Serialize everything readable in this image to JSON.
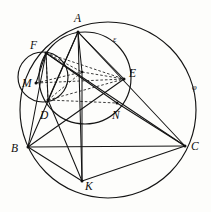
{
  "figure": {
    "width": 211,
    "height": 212,
    "background_color": "#fdfdfb",
    "ink_color": "#141414"
  },
  "points": [
    {
      "id": "A",
      "label": "A",
      "x": 78,
      "y": 32,
      "label_x": 74,
      "label_y": 13
    },
    {
      "id": "F",
      "label": "F",
      "x": 46,
      "y": 53,
      "label_x": 30,
      "label_y": 40
    },
    {
      "id": "M",
      "label": "M",
      "x": 36,
      "y": 83,
      "label_x": 22,
      "label_y": 78
    },
    {
      "id": "D",
      "label": "D",
      "x": 48,
      "y": 100,
      "label_x": 40,
      "label_y": 110
    },
    {
      "id": "E",
      "label": "E",
      "x": 124,
      "y": 79,
      "label_x": 129,
      "label_y": 68
    },
    {
      "id": "N",
      "label": "N",
      "x": 117,
      "y": 103,
      "label_x": 112,
      "label_y": 110
    },
    {
      "id": "B",
      "label": "B",
      "x": 28,
      "y": 147,
      "label_x": 11,
      "label_y": 143
    },
    {
      "id": "C",
      "label": "C",
      "x": 185,
      "y": 146,
      "label_x": 191,
      "label_y": 141
    },
    {
      "id": "K",
      "label": "K",
      "x": 82,
      "y": 181,
      "label_x": 85,
      "label_y": 181
    },
    {
      "id": "P",
      "label": "",
      "x": 82,
      "y": 72,
      "label_x": 0,
      "label_y": 0
    }
  ],
  "curves": [
    {
      "id": "phi",
      "label": "φ",
      "kind": "circle",
      "cx": 108,
      "cy": 110,
      "r": 88,
      "label_x": 192,
      "label_y": 83,
      "description": "large circumscribed circle phi through A, B, C, K"
    },
    {
      "id": "epsilon",
      "label": "ε",
      "kind": "circle",
      "cx": 85,
      "cy": 78,
      "r": 46,
      "label_x": 113,
      "label_y": 35,
      "description": "medium circle epsilon through A, F, D, N, E"
    },
    {
      "id": "small",
      "label": "",
      "kind": "circle",
      "cx": 43,
      "cy": 77,
      "r": 25,
      "label_x": 0,
      "label_y": 0,
      "description": "small circle through F, M, D"
    }
  ],
  "solid_segments": [
    {
      "id": "A-B",
      "from": "A",
      "to": "B"
    },
    {
      "id": "A-C",
      "from": "A",
      "to": "C"
    },
    {
      "id": "A-D",
      "from": "A",
      "to": "D"
    },
    {
      "id": "A-E",
      "from": "A",
      "to": "E"
    },
    {
      "id": "A-K",
      "from": "A",
      "to": "K"
    },
    {
      "id": "B-C",
      "from": "B",
      "to": "C"
    },
    {
      "id": "B-K",
      "from": "B",
      "to": "K"
    },
    {
      "id": "B-E",
      "from": "B",
      "to": "E"
    },
    {
      "id": "B-F",
      "from": "B",
      "to": "F"
    },
    {
      "id": "C-K",
      "from": "C",
      "to": "K"
    },
    {
      "id": "C-F",
      "from": "C",
      "to": "F"
    },
    {
      "id": "C-N",
      "from": "C",
      "to": "N"
    },
    {
      "id": "D-K",
      "from": "D",
      "to": "K"
    },
    {
      "id": "F-N",
      "from": "F",
      "to": "N"
    },
    {
      "id": "F-D",
      "from": "F",
      "to": "D"
    },
    {
      "id": "F-M",
      "from": "F",
      "to": "M"
    },
    {
      "id": "A-P",
      "from": "A",
      "to": "P"
    },
    {
      "id": "P-K",
      "from": "P",
      "to": "K"
    }
  ],
  "dashed_segments": [
    {
      "id": "F-E-dashed",
      "from": "F",
      "to": "E"
    },
    {
      "id": "F-P-dashed",
      "from": "F",
      "to": "P"
    },
    {
      "id": "D-E-dashed",
      "from": "D",
      "to": "E"
    },
    {
      "id": "D-P-dashed",
      "from": "D",
      "to": "P"
    },
    {
      "id": "P-E-dashed",
      "from": "P",
      "to": "E"
    },
    {
      "id": "F-D-dashed",
      "from": "F",
      "to": "D"
    },
    {
      "id": "M-E-dashed",
      "from": "M",
      "to": "E"
    },
    {
      "id": "M-P-dashed",
      "from": "M",
      "to": "P"
    },
    {
      "id": "D-N-dashed",
      "from": "D",
      "to": "N"
    }
  ]
}
